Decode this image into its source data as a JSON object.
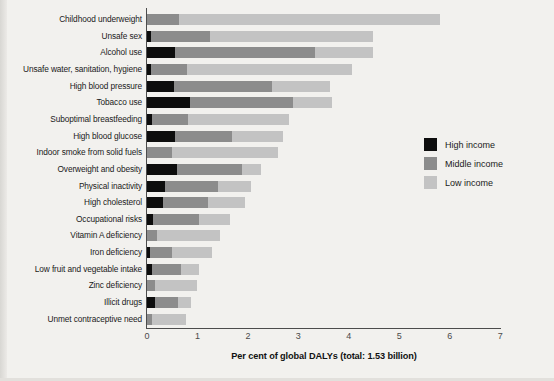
{
  "chart_data": {
    "type": "bar",
    "orientation": "horizontal",
    "stacked": true,
    "title": "",
    "xlabel": "Per cent of global DALYs (total: 1.53 billion)",
    "ylabel": "",
    "xlim": [
      0,
      7
    ],
    "xticks": [
      0,
      1,
      2,
      3,
      4,
      5,
      6,
      7
    ],
    "xticklabels": [
      "0",
      "1",
      "2",
      "3",
      "4",
      "5",
      "6",
      "7"
    ],
    "grid": false,
    "legend_position": "right",
    "categories": [
      "Childhood underweight",
      "Unsafe sex",
      "Alcohol use",
      "Unsafe water, sanitation, hygiene",
      "High blood pressure",
      "Tobacco use",
      "Suboptimal breastfeeding",
      "High blood glucose",
      "Indoor smoke from solid fuels",
      "Overweight and obesity",
      "Physical inactivity",
      "High cholesterol",
      "Occupational risks",
      "Vitamin A deficiency",
      "Iron deficiency",
      "Low fruit and vegetable intake",
      "Zinc deficiency",
      "Illicit drugs",
      "Unmet contraceptive need"
    ],
    "series": [
      {
        "name": "High income",
        "color": "#0d0d0d",
        "values": [
          0.0,
          0.08,
          0.55,
          0.08,
          0.53,
          0.85,
          0.1,
          0.55,
          0.0,
          0.59,
          0.36,
          0.32,
          0.12,
          0.0,
          0.06,
          0.1,
          0.0,
          0.16,
          0.0
        ]
      },
      {
        "name": "Middle income",
        "color": "#8c8c8c",
        "values": [
          0.63,
          1.17,
          2.78,
          0.71,
          1.95,
          2.04,
          0.71,
          1.13,
          0.5,
          1.29,
          1.05,
          0.89,
          0.91,
          0.2,
          0.44,
          0.58,
          0.16,
          0.46,
          0.1
        ]
      },
      {
        "name": "Low income",
        "color": "#c3c3c3",
        "values": [
          5.18,
          3.23,
          1.15,
          3.28,
          1.15,
          0.78,
          2.01,
          1.02,
          2.1,
          0.38,
          0.65,
          0.73,
          0.62,
          1.25,
          0.79,
          0.35,
          0.83,
          0.25,
          0.67
        ]
      }
    ],
    "totals": [
      5.81,
      4.48,
      4.48,
      4.07,
      3.63,
      3.67,
      2.82,
      2.7,
      2.6,
      2.26,
      2.06,
      1.94,
      1.65,
      1.45,
      1.29,
      1.03,
      0.99,
      0.87,
      0.77
    ]
  },
  "legend": {
    "items": [
      {
        "label": "High income",
        "color": "#0d0d0d"
      },
      {
        "label": "Middle income",
        "color": "#8c8c8c"
      },
      {
        "label": "Low income",
        "color": "#c3c3c3"
      }
    ]
  }
}
